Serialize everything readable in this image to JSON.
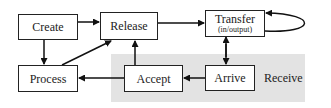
{
  "diagram": {
    "region": {
      "label": "Receive",
      "color": "#e3e3e3"
    },
    "nodes": [
      {
        "id": "create",
        "label": "Create"
      },
      {
        "id": "release",
        "label": "Release"
      },
      {
        "id": "transfer",
        "label": "Transfer",
        "sublabel": "(in/output)"
      },
      {
        "id": "process",
        "label": "Process"
      },
      {
        "id": "accept",
        "label": "Accept"
      },
      {
        "id": "arrive",
        "label": "Arrive"
      }
    ],
    "edges": [
      {
        "from": "create",
        "to": "release"
      },
      {
        "from": "create",
        "to": "process"
      },
      {
        "from": "process",
        "to": "release"
      },
      {
        "from": "release",
        "to": "transfer"
      },
      {
        "from": "transfer",
        "to": "transfer"
      },
      {
        "from": "transfer",
        "to": "arrive",
        "bidirectional": true
      },
      {
        "from": "arrive",
        "to": "accept"
      },
      {
        "from": "accept",
        "to": "process"
      },
      {
        "from": "accept",
        "to": "release"
      }
    ]
  }
}
